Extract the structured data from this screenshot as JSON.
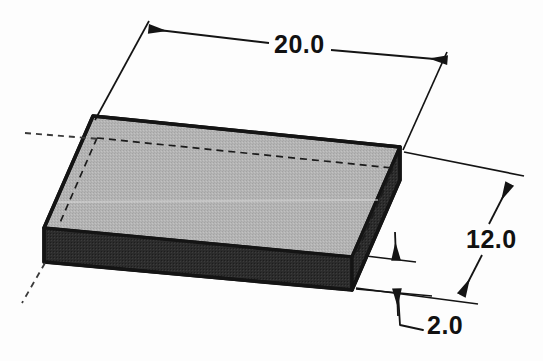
{
  "drawing": {
    "title": "Isometric rectangular block with dimensions",
    "object_name": "rectangular-block",
    "projection": "isometric",
    "units_note": "",
    "background_color": "#fdfdfd",
    "line_color": "#141414",
    "faces": {
      "top_face_color": "#b2b2b2",
      "front_face_color": "#2b2b2b",
      "right_face_color": "#2f2f2f",
      "top_face_name": "top-face",
      "front_face_name": "front-face",
      "right_face_name": "right-face"
    },
    "dimensions": [
      {
        "id": "length",
        "label": "20.0",
        "value": 20.0,
        "orientation": "top-horizontal",
        "arrow_style": "double-ended",
        "name": "dimension-length-20"
      },
      {
        "id": "width",
        "label": "12.0",
        "value": 12.0,
        "orientation": "right-diagonal",
        "arrow_style": "double-ended",
        "name": "dimension-width-12"
      },
      {
        "id": "height",
        "label": "2.0",
        "value": 2.0,
        "orientation": "right-thickness",
        "arrow_style": "double-ended-with-leader",
        "name": "dimension-height-2"
      }
    ],
    "hidden_edges": {
      "style": "dashed",
      "name": "hidden-edge-lines",
      "count": 3
    },
    "axis_lines": {
      "style": "dashed",
      "name": "projection-axis-lines",
      "count": 2
    }
  }
}
